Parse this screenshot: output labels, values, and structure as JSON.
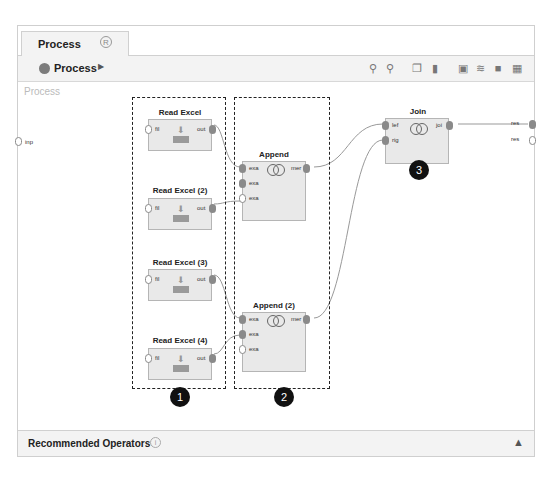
{
  "tab": {
    "label": "Process",
    "icon": "restore-icon"
  },
  "breadcrumb": {
    "label": "Process"
  },
  "toolbar": {
    "icons": [
      "zoom-in-icon",
      "zoom-out-icon",
      "copy-icon",
      "paste-icon",
      "add-note-icon",
      "auto-wire-icon",
      "layers-icon",
      "fit-icon"
    ]
  },
  "canvas": {
    "label": "Process",
    "input_port": "inp",
    "output_ports": [
      "res",
      "res"
    ]
  },
  "operators": {
    "read1": {
      "title": "Read Excel",
      "in": "fil",
      "out": "out"
    },
    "read2": {
      "title": "Read Excel (2)",
      "in": "fil",
      "out": "out"
    },
    "read3": {
      "title": "Read Excel (3)",
      "in": "fil",
      "out": "out"
    },
    "read4": {
      "title": "Read Excel (4)",
      "in": "fil",
      "out": "out"
    },
    "append1": {
      "title": "Append",
      "in": [
        "exa",
        "exa",
        "exa"
      ],
      "out": "mer"
    },
    "append2": {
      "title": "Append (2)",
      "in": [
        "exa",
        "exa",
        "exa"
      ],
      "out": "mer"
    },
    "join": {
      "title": "Join",
      "in": [
        "lef",
        "rig"
      ],
      "out": "joi"
    }
  },
  "badges": [
    "1",
    "2",
    "3"
  ],
  "footer": {
    "label": "Recommended Operators",
    "info_icon": "info-icon",
    "collapse_icon": "chevron-up-icon"
  }
}
